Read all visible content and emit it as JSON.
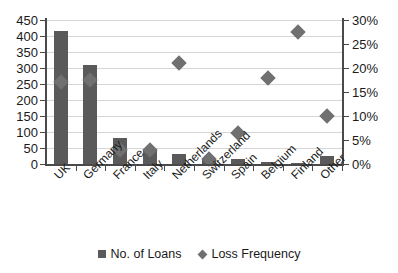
{
  "chart_data": {
    "type": "bar",
    "title": "",
    "subtitle": "",
    "xlabel": "",
    "ylabel": "",
    "categories": [
      "UK",
      "Germany",
      "France",
      "Italy",
      "Netherlands",
      "Switzerland",
      "Spain",
      "Belgium",
      "Finland",
      "Other"
    ],
    "series": [
      {
        "name": "No. of Loans",
        "type": "bar",
        "axis": "left",
        "color": "#5a5a5a",
        "marker": "square",
        "values": [
          415,
          310,
          80,
          48,
          30,
          18,
          15,
          7,
          3,
          25
        ]
      },
      {
        "name": "Loss Frequency",
        "type": "scatter",
        "axis": "right",
        "color": "#707070",
        "marker": "diamond",
        "values": [
          17,
          17.5,
          3,
          3,
          21,
          1,
          6.5,
          18,
          27.5,
          10
        ]
      }
    ],
    "left_axis": {
      "min": 0,
      "max": 450,
      "step": 50,
      "ticks": [
        "0",
        "50",
        "100",
        "150",
        "200",
        "250",
        "300",
        "350",
        "400",
        "450"
      ]
    },
    "right_axis": {
      "min": 0,
      "max": 30,
      "step": 5,
      "format": "percent",
      "ticks": [
        "0%",
        "5%",
        "10%",
        "15%",
        "20%",
        "25%",
        "30%"
      ]
    },
    "grid": true,
    "legend_position": "bottom",
    "legend": [
      {
        "label": "No. of Loans",
        "marker": "square",
        "color": "#5a5a5a"
      },
      {
        "label": "Loss Frequency",
        "marker": "diamond",
        "color": "#707070"
      }
    ]
  }
}
